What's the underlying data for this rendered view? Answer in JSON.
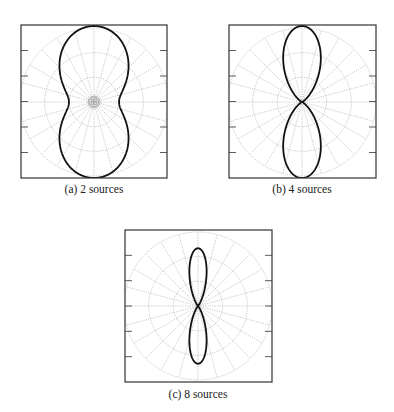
{
  "figure": {
    "panels": [
      {
        "id": "a",
        "caption": "(a) 2 sources"
      },
      {
        "id": "b",
        "caption": "(b) 4 sources"
      },
      {
        "id": "c",
        "caption": "(c) 8 sources"
      }
    ]
  },
  "colors": {
    "frame": "#333333",
    "grid": "#b0b0b0",
    "pattern": "#111111",
    "caption": "#222222"
  },
  "chart_data": [
    {
      "type": "polar",
      "title": "(a) 2 sources",
      "sources": 2,
      "grid": {
        "rings": 3,
        "spoke_step_deg": 15
      },
      "ticks_per_side": 5,
      "pattern": {
        "description": "peanut-shaped broad beam, main lobes along vertical axis",
        "r_at_0deg": 1.0,
        "r_at_90deg": 0.33,
        "model": "r = floor + (1-floor)*|cos(phi)|^exp",
        "floor": 0.33,
        "exp": 2.2
      },
      "layout": {
        "box": [
          21,
          25,
          146,
          153
        ],
        "center": [
          94,
          102
        ],
        "outer_radius": 74,
        "lobe_scale": 76
      }
    },
    {
      "type": "polar",
      "title": "(b) 4 sources",
      "sources": 4,
      "grid": {
        "rings": 3,
        "spoke_step_deg": 15
      },
      "ticks_per_side": 5,
      "pattern": {
        "description": "figure-eight beam with nulls along horizontal axis",
        "r_at_0deg": 1.0,
        "r_at_90deg": 0.0,
        "model": "r = |cos(phi)|^exp",
        "floor": 0.0,
        "exp": 5.5
      },
      "layout": {
        "box": [
          229,
          25,
          147,
          153
        ],
        "center": [
          302,
          102
        ],
        "outer_radius": 74,
        "lobe_scale": 76
      }
    },
    {
      "type": "polar",
      "title": "(c) 8 sources",
      "sources": 8,
      "grid": {
        "rings": 3,
        "spoke_step_deg": 15
      },
      "ticks_per_side": 5,
      "pattern": {
        "description": "narrow figure-eight beam with reduced extent",
        "r_at_0deg": 0.76,
        "r_at_90deg": 0.0,
        "model": "r = peak*|cos(phi)|^exp",
        "floor": 0.0,
        "exp": 16,
        "peak": 0.76
      },
      "layout": {
        "box": [
          125,
          230,
          147,
          152
        ],
        "center": [
          198,
          306
        ],
        "outer_radius": 74,
        "lobe_scale": 76
      }
    }
  ]
}
